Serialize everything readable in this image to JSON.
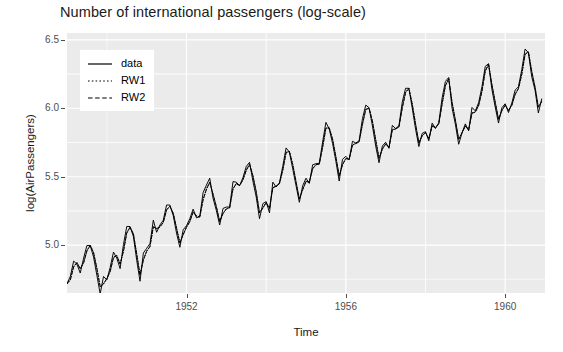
{
  "chart_data": {
    "type": "line",
    "title": "Number of international passengers (log-scale)",
    "xlabel": "Time",
    "ylabel": "log(AirPassengers)",
    "xlim": [
      1949.0,
      1961.0
    ],
    "ylim": [
      4.65,
      6.55
    ],
    "xticks": [
      1952,
      1956,
      1960
    ],
    "xtick_labels": [
      "1952",
      "1956",
      "1960"
    ],
    "yticks": [
      5.0,
      5.5,
      6.0,
      6.5
    ],
    "ytick_labels": [
      "5.0",
      "5.5",
      "6.0",
      "6.5"
    ],
    "grid": true,
    "legend_position": "top-left",
    "panel_background": "#ebebeb",
    "grid_color": "#ffffff",
    "line_color": "#000000",
    "x": [
      1949.0,
      1949.083,
      1949.167,
      1949.25,
      1949.333,
      1949.417,
      1949.5,
      1949.583,
      1949.667,
      1949.75,
      1949.833,
      1949.917,
      1950.0,
      1950.083,
      1950.167,
      1950.25,
      1950.333,
      1950.417,
      1950.5,
      1950.583,
      1950.667,
      1950.75,
      1950.833,
      1950.917,
      1951.0,
      1951.083,
      1951.167,
      1951.25,
      1951.333,
      1951.417,
      1951.5,
      1951.583,
      1951.667,
      1951.75,
      1951.833,
      1951.917,
      1952.0,
      1952.083,
      1952.167,
      1952.25,
      1952.333,
      1952.417,
      1952.5,
      1952.583,
      1952.667,
      1952.75,
      1952.833,
      1952.917,
      1953.0,
      1953.083,
      1953.167,
      1953.25,
      1953.333,
      1953.417,
      1953.5,
      1953.583,
      1953.667,
      1953.75,
      1953.833,
      1953.917,
      1954.0,
      1954.083,
      1954.167,
      1954.25,
      1954.333,
      1954.417,
      1954.5,
      1954.583,
      1954.667,
      1954.75,
      1954.833,
      1954.917,
      1955.0,
      1955.083,
      1955.167,
      1955.25,
      1955.333,
      1955.417,
      1955.5,
      1955.583,
      1955.667,
      1955.75,
      1955.833,
      1955.917,
      1956.0,
      1956.083,
      1956.167,
      1956.25,
      1956.333,
      1956.417,
      1956.5,
      1956.583,
      1956.667,
      1956.75,
      1956.833,
      1956.917,
      1957.0,
      1957.083,
      1957.167,
      1957.25,
      1957.333,
      1957.417,
      1957.5,
      1957.583,
      1957.667,
      1957.75,
      1957.833,
      1957.917,
      1958.0,
      1958.083,
      1958.167,
      1958.25,
      1958.333,
      1958.417,
      1958.5,
      1958.583,
      1958.667,
      1958.75,
      1958.833,
      1958.917,
      1959.0,
      1959.083,
      1959.167,
      1959.25,
      1959.333,
      1959.417,
      1959.5,
      1959.583,
      1959.667,
      1959.75,
      1959.833,
      1959.917,
      1960.0,
      1960.083,
      1960.167,
      1960.25,
      1960.333,
      1960.417,
      1960.5,
      1960.583,
      1960.667,
      1960.75,
      1960.833,
      1960.917
    ],
    "series": [
      {
        "name": "data",
        "style": "solid",
        "values": [
          4.718,
          4.771,
          4.883,
          4.86,
          4.796,
          4.905,
          4.997,
          4.997,
          4.913,
          4.779,
          4.644,
          4.771,
          4.745,
          4.836,
          4.949,
          4.905,
          4.828,
          5.004,
          5.136,
          5.136,
          5.063,
          4.89,
          4.736,
          4.942,
          4.977,
          5.011,
          5.182,
          5.094,
          5.147,
          5.182,
          5.293,
          5.293,
          5.215,
          5.088,
          4.984,
          5.112,
          5.142,
          5.193,
          5.263,
          5.199,
          5.209,
          5.384,
          5.438,
          5.489,
          5.342,
          5.252,
          5.147,
          5.268,
          5.278,
          5.278,
          5.464,
          5.46,
          5.434,
          5.493,
          5.575,
          5.605,
          5.468,
          5.352,
          5.193,
          5.303,
          5.318,
          5.236,
          5.46,
          5.425,
          5.455,
          5.576,
          5.71,
          5.68,
          5.557,
          5.434,
          5.313,
          5.434,
          5.489,
          5.451,
          5.587,
          5.595,
          5.598,
          5.753,
          5.897,
          5.849,
          5.743,
          5.613,
          5.468,
          5.627,
          5.649,
          5.624,
          5.759,
          5.746,
          5.762,
          5.924,
          6.023,
          6.004,
          5.872,
          5.724,
          5.602,
          5.724,
          5.752,
          5.707,
          5.875,
          5.852,
          5.872,
          6.045,
          6.146,
          6.146,
          6.001,
          5.849,
          5.72,
          5.817,
          5.829,
          5.762,
          5.892,
          5.852,
          5.894,
          6.075,
          6.196,
          6.225,
          6.001,
          5.883,
          5.737,
          5.82,
          5.886,
          5.835,
          6.006,
          5.981,
          6.04,
          6.157,
          6.306,
          6.326,
          6.138,
          6.009,
          5.892,
          6.004,
          6.033,
          5.969,
          6.038,
          6.133,
          6.157,
          6.282,
          6.433,
          6.407,
          6.23,
          6.133,
          5.966,
          6.068
        ]
      },
      {
        "name": "RW1",
        "style": "dotted",
        "values": [
          4.718,
          4.748,
          4.843,
          4.873,
          4.828,
          4.872,
          4.96,
          4.999,
          4.946,
          4.829,
          4.697,
          4.718,
          4.756,
          4.808,
          4.911,
          4.925,
          4.863,
          4.956,
          5.09,
          5.131,
          5.083,
          4.935,
          4.783,
          4.892,
          4.957,
          4.991,
          5.135,
          5.122,
          5.134,
          5.167,
          5.259,
          5.285,
          5.234,
          5.125,
          5.018,
          5.078,
          5.132,
          5.173,
          5.243,
          5.213,
          5.207,
          5.333,
          5.41,
          5.46,
          5.372,
          5.281,
          5.173,
          5.232,
          5.266,
          5.274,
          5.412,
          5.451,
          5.437,
          5.478,
          5.548,
          5.592,
          5.508,
          5.391,
          5.237,
          5.272,
          5.312,
          5.27,
          5.42,
          5.432,
          5.45,
          5.549,
          5.678,
          5.685,
          5.59,
          5.464,
          5.338,
          5.406,
          5.467,
          5.461,
          5.559,
          5.589,
          5.593,
          5.717,
          5.856,
          5.858,
          5.775,
          5.646,
          5.506,
          5.589,
          5.634,
          5.628,
          5.732,
          5.744,
          5.755,
          5.884,
          5.993,
          6.002,
          5.907,
          5.769,
          5.636,
          5.703,
          5.74,
          5.716,
          5.843,
          5.851,
          5.864,
          6.005,
          6.117,
          6.146,
          6.032,
          5.887,
          5.749,
          5.8,
          5.823,
          5.779,
          5.872,
          5.86,
          5.887,
          6.033,
          6.166,
          6.216,
          6.044,
          5.914,
          5.774,
          5.822,
          5.872,
          5.843,
          5.966,
          5.973,
          6.021,
          6.125,
          6.273,
          6.322,
          6.174,
          6.045,
          5.921,
          5.983,
          6.025,
          5.984,
          6.023,
          6.103,
          6.145,
          6.249,
          6.396,
          6.413,
          6.27,
          6.155,
          6.009,
          6.051
        ]
      },
      {
        "name": "RW2",
        "style": "dashed",
        "values": [
          4.718,
          4.745,
          4.84,
          4.87,
          4.826,
          4.87,
          4.958,
          4.997,
          4.944,
          4.827,
          4.695,
          4.716,
          4.754,
          4.806,
          4.909,
          4.923,
          4.861,
          4.954,
          5.088,
          5.129,
          5.081,
          4.933,
          4.781,
          4.89,
          4.955,
          4.989,
          5.133,
          5.12,
          5.132,
          5.165,
          5.257,
          5.283,
          5.232,
          5.123,
          5.016,
          5.076,
          5.13,
          5.171,
          5.241,
          5.211,
          5.205,
          5.331,
          5.408,
          5.458,
          5.37,
          5.279,
          5.171,
          5.23,
          5.264,
          5.272,
          5.41,
          5.449,
          5.435,
          5.476,
          5.546,
          5.59,
          5.506,
          5.389,
          5.235,
          5.27,
          5.31,
          5.268,
          5.418,
          5.43,
          5.448,
          5.547,
          5.676,
          5.683,
          5.588,
          5.462,
          5.336,
          5.404,
          5.465,
          5.459,
          5.557,
          5.587,
          5.591,
          5.715,
          5.854,
          5.856,
          5.773,
          5.644,
          5.504,
          5.587,
          5.632,
          5.626,
          5.73,
          5.742,
          5.753,
          5.882,
          5.991,
          6.0,
          5.905,
          5.767,
          5.634,
          5.701,
          5.738,
          5.714,
          5.841,
          5.849,
          5.862,
          6.003,
          6.115,
          6.144,
          6.03,
          5.885,
          5.747,
          5.798,
          5.821,
          5.777,
          5.87,
          5.858,
          5.885,
          6.031,
          6.164,
          6.214,
          6.042,
          5.912,
          5.772,
          5.82,
          5.87,
          5.841,
          5.964,
          5.971,
          6.019,
          6.123,
          6.271,
          6.32,
          6.172,
          6.043,
          5.919,
          5.981,
          6.023,
          5.982,
          6.021,
          6.101,
          6.143,
          6.247,
          6.394,
          6.411,
          6.268,
          6.153,
          6.007,
          6.049
        ]
      }
    ]
  },
  "legend": {
    "items": [
      {
        "label": "data",
        "style": "solid"
      },
      {
        "label": "RW1",
        "style": "dotted"
      },
      {
        "label": "RW2",
        "style": "dashed"
      }
    ]
  }
}
